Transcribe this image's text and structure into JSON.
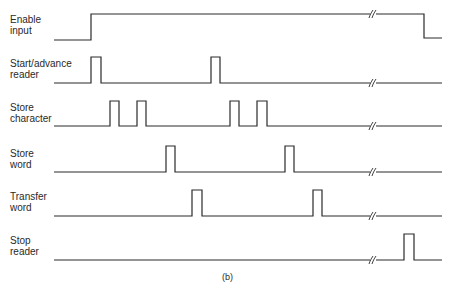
{
  "figure": {
    "caption": "(b)",
    "line_color": "#2a2a2a",
    "signals": [
      {
        "name": "Enable input",
        "label": "Enable\ninput",
        "label_top": 14,
        "base_y": 40,
        "high_y": 14,
        "path": "M54,40 H91 V14 H424 V38 H442",
        "break_x": 372
      },
      {
        "name": "Start/advance reader",
        "label": "Start/advance\nreader",
        "label_top": 58,
        "base_y": 83,
        "high_y": 57,
        "path": "M54,83 H91 V57 H101 V83 H211 V57 H220 V83 H442",
        "break_x": 372
      },
      {
        "name": "Store character",
        "label": "Store\ncharacter",
        "label_top": 102,
        "base_y": 126,
        "high_y": 101,
        "path": "M54,126 H110 V101 H119 V126 H137 V101 H146 V126 H230 V101 H239 V126 H257 V101 H267 V126 H442",
        "break_x": 372
      },
      {
        "name": "Store word",
        "label": "Store\nword",
        "label_top": 148,
        "base_y": 172,
        "high_y": 146,
        "path": "M54,172 H166 V146 H175 V172 H285 V146 H294 V172 H442",
        "break_x": 372
      },
      {
        "name": "Transfer word",
        "label": "Transfer\nword",
        "label_top": 191,
        "base_y": 216,
        "high_y": 190,
        "path": "M54,216 H192 V190 H202 V216 H313 V190 H322 V216 H442",
        "break_x": 372
      },
      {
        "name": "Stop reader",
        "label": "Stop\nreader",
        "label_top": 235,
        "base_y": 260,
        "high_y": 234,
        "path": "M54,260 H404 V234 H414 V260 H442",
        "break_x": 372
      }
    ]
  }
}
